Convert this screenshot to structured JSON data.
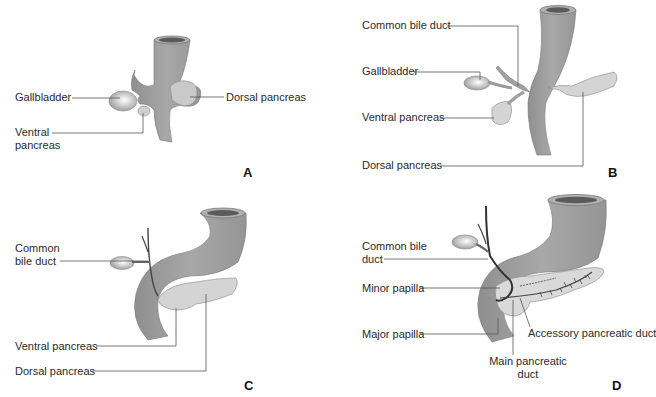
{
  "figure": {
    "colors": {
      "duodenum": "#9a9a9a",
      "duodenum_light": "#b5b5b5",
      "pancreas": "#d4d4d4",
      "duct_dark": "#333333",
      "leader_line": "#555555",
      "lumen": "#5a5a5a"
    },
    "panels": [
      {
        "letter": "A",
        "labels": {
          "gallbladder": "Gallbladder",
          "ventral_pancreas_1": "Ventral",
          "ventral_pancreas_2": "pancreas",
          "dorsal_pancreas": "Dorsal pancreas"
        }
      },
      {
        "letter": "B",
        "labels": {
          "common_bile_duct": "Common bile duct",
          "gallbladder": "Gallbladder",
          "ventral_pancreas": "Ventral pancreas",
          "dorsal_pancreas": "Dorsal pancreas"
        }
      },
      {
        "letter": "C",
        "labels": {
          "common_bile_duct_1": "Common",
          "common_bile_duct_2": "bile duct",
          "ventral_pancreas": "Ventral pancreas",
          "dorsal_pancreas": "Dorsal pancreas"
        }
      },
      {
        "letter": "D",
        "labels": {
          "common_bile_duct_1": "Common bile",
          "common_bile_duct_2": "duct",
          "minor_papilla": "Minor papilla",
          "major_papilla": "Major papilla",
          "accessory_pancreatic_duct": "Accessory pancreatic duct",
          "main_pancreatic_duct_1": "Main pancreatic",
          "main_pancreatic_duct_2": "duct"
        }
      }
    ]
  }
}
